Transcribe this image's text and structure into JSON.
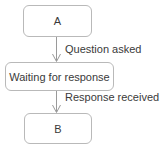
{
  "diagram": {
    "type": "flowchart",
    "orientation": "vertical",
    "colors": {
      "box_border": "#b9b9b9",
      "box_fill": "#ffffff",
      "text": "#3a3a3a",
      "arrow": "#9a9a9a",
      "background": "#ffffff"
    },
    "nodes": [
      {
        "id": "a",
        "label": "A",
        "shape": "rounded-rectangle"
      },
      {
        "id": "waiting",
        "label": "Waiting for response",
        "shape": "rounded-rectangle"
      },
      {
        "id": "b",
        "label": "B",
        "shape": "rounded-rectangle"
      }
    ],
    "edges": [
      {
        "id": "question",
        "from": "a",
        "to": "waiting",
        "label": "Question asked",
        "arrowhead": "open-v",
        "direction": "down"
      },
      {
        "id": "response",
        "from": "waiting",
        "to": "b",
        "label": "Response received",
        "arrowhead": "open-v",
        "direction": "down"
      }
    ]
  }
}
